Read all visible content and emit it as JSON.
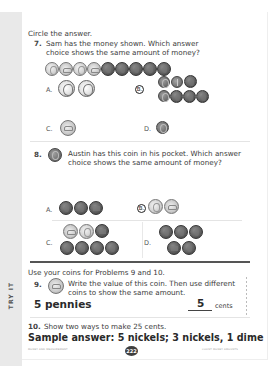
{
  "side_tab": {
    "label": "TRY IT"
  },
  "instructions": {
    "circle": "Circle the answer.",
    "use_coins": "Use your coins for Problems 9 and 10."
  },
  "problem7": {
    "number": "7.",
    "text_line1": "Sam has the money shown. Which answer",
    "text_line2": "choice shows the same amount of money?",
    "given_coins": [
      "nickel",
      "nickel-tail",
      "nickel",
      "nickel-tail",
      "penny",
      "penny",
      "penny",
      "penny",
      "penny"
    ],
    "choices": [
      {
        "letter": "A.",
        "coins": [
          "quarter",
          "quarter"
        ],
        "selected": false
      },
      {
        "letter": "B.",
        "coins": [
          "dime",
          "dime-tail",
          "penny",
          "dime",
          "penny",
          "penny",
          "penny"
        ],
        "selected": true
      },
      {
        "letter": "C.",
        "coins": [
          "nickel-tail"
        ],
        "selected": false
      },
      {
        "letter": "D.",
        "coins": [
          "dime"
        ],
        "selected": false
      }
    ]
  },
  "problem8": {
    "number": "8.",
    "coin": "dime",
    "text_line1": "Austin has this coin in his pocket. Which answer",
    "text_line2": "choice shows the same amount of money?",
    "choices": [
      {
        "letter": "A.",
        "coins": [
          "penny",
          "penny",
          "penny-tail"
        ],
        "selected": false
      },
      {
        "letter": "B.",
        "coins": [
          "nickel",
          "nickel-tail"
        ],
        "selected": true
      },
      {
        "letter": "C.",
        "coins": [
          "nickel-tail",
          "nickel",
          "penny-tail",
          "penny",
          "penny",
          "penny",
          "penny"
        ],
        "selected": false
      },
      {
        "letter": "D.",
        "coins": [
          "penny",
          "penny",
          "penny",
          "penny-tail",
          "penny"
        ],
        "selected": false
      }
    ]
  },
  "problem9": {
    "number": "9.",
    "coin": "nickel-tail",
    "text_line1": "Write the value of this coin. Then use different",
    "text_line2": "coins to show the same amount.",
    "answer_work": "5 pennies",
    "answer_value": "5",
    "unit": "cents"
  },
  "problem10": {
    "number": "10.",
    "text": "Show two ways to make 25 cents.",
    "answer": "Sample answer: 5 nickels; 3 nickels, 1 dime"
  },
  "footer": {
    "left": "MONEY AND MEASUREMENT",
    "page_number": "222",
    "right": "COUNT MONEY AMOUNTS"
  }
}
